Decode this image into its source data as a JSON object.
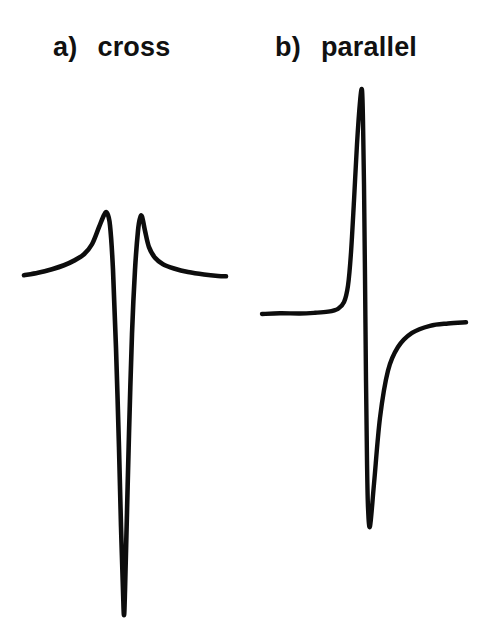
{
  "figure": {
    "background_color": "#ffffff",
    "trace_color": "#0d0d0d",
    "width": 480,
    "height": 641
  },
  "panels": [
    {
      "id": "a",
      "tag": "a)",
      "name": "cross",
      "label_full": "a) cross"
    },
    {
      "id": "b",
      "tag": "b)",
      "name": "parallel",
      "label_full": "b) parallel"
    }
  ],
  "chart_data": [
    {
      "type": "line",
      "title": "a) cross",
      "xlabel": "",
      "ylabel": "",
      "grid": false,
      "legend": "none",
      "axis_visible": false,
      "description": "EPR spectrum in cross (perpendicular) mode: symmetric pair of sharp upward peaks flanking a single deep narrow downward trough at centre.",
      "xlim": [
        0,
        240
      ],
      "ylim": [
        -100,
        22
      ],
      "baseline_y": 0,
      "features": {
        "peaks": [
          {
            "x": 107,
            "y": 18
          },
          {
            "x": 142,
            "y": 17
          }
        ],
        "trough": {
          "x": 124,
          "y": -95
        },
        "left_baseline_x": 24,
        "right_baseline_x": 226
      },
      "series": [
        {
          "name": "cross-mode signal",
          "x": [
            24,
            38,
            52,
            64,
            74,
            84,
            92,
            99,
            104,
            107,
            110,
            113,
            116,
            119,
            121,
            123,
            124,
            125,
            127,
            129,
            132,
            135,
            138,
            140,
            142,
            145,
            149,
            155,
            163,
            174,
            188,
            204,
            218,
            226
          ],
          "y": [
            0.5,
            1.2,
            2.2,
            3.3,
            4.6,
            6.4,
            9.2,
            14.0,
            17.4,
            18.0,
            14.5,
            2.0,
            -20.0,
            -48.0,
            -70.0,
            -88.0,
            -95.0,
            -88.0,
            -66.0,
            -44.0,
            -16.0,
            2.0,
            13.0,
            16.5,
            17.0,
            13.0,
            8.4,
            5.4,
            3.6,
            2.4,
            1.4,
            0.7,
            0.3,
            0.2
          ]
        }
      ]
    },
    {
      "type": "line",
      "title": "b) parallel",
      "xlabel": "",
      "ylabel": "",
      "grid": false,
      "legend": "none",
      "axis_visible": false,
      "description": "EPR spectrum in parallel mode: flat baseline rising steeply to a very tall narrow positive peak, then dropping through baseline into a deep narrow trough before recovering to a slightly offset baseline.",
      "xlim": [
        0,
        240
      ],
      "ylim": [
        -100,
        100
      ],
      "baseline_y": 0,
      "features": {
        "peak": {
          "x": 362,
          "y": 95
        },
        "trough": {
          "x": 366,
          "y": -90
        },
        "left_baseline_x": 262,
        "right_baseline_x": 466
      },
      "series": [
        {
          "name": "parallel-mode signal",
          "x": [
            262,
            280,
            300,
            315,
            328,
            338,
            344,
            348,
            351,
            354,
            357,
            360,
            362,
            363,
            364,
            365,
            366,
            367,
            368,
            370,
            374,
            380,
            388,
            398,
            412,
            430,
            448,
            466
          ],
          "y": [
            0.0,
            0.3,
            0.2,
            0.5,
            1.0,
            2.2,
            5.0,
            12.0,
            26.0,
            48.0,
            72.0,
            90.0,
            95.0,
            82.0,
            55.0,
            16.0,
            -28.0,
            -62.0,
            -82.0,
            -90.0,
            -72.0,
            -44.0,
            -24.0,
            -14.0,
            -8.0,
            -5.0,
            -4.0,
            -3.5
          ]
        }
      ]
    }
  ]
}
